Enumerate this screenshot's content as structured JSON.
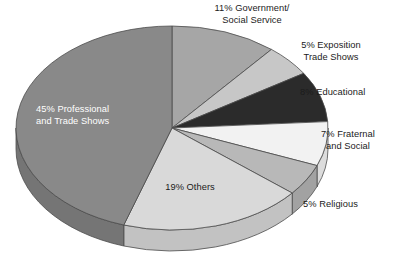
{
  "chart_data": {
    "type": "pie",
    "title": "",
    "subtitle": "",
    "xlabel": "",
    "ylabel": "",
    "legend_position": "none",
    "grid": false,
    "style": "3d-pie",
    "total": 100,
    "units": "percent",
    "categories": [
      "Government/Social Service",
      "Exposition Trade Shows",
      "Educational",
      "Fraternal and Social",
      "Religious",
      "Others",
      "Professional and Trade Shows"
    ],
    "values": [
      11,
      5,
      8,
      7,
      5,
      19,
      45
    ],
    "colors": [
      "#a6a6a6",
      "#c7c7c7",
      "#2b2b2b",
      "#f2f2f2",
      "#b8b8b8",
      "#d9d9d9",
      "#898989"
    ],
    "slices": [
      {
        "label": "11% Government/\nSocial Service",
        "name": "Government/Social Service",
        "value": 11,
        "color": "#a6a6a6",
        "side_color": "#8e8e8e",
        "label_placement": "outside-top",
        "label_color": "#1b1b1b"
      },
      {
        "label": "5% Exposition\nTrade Shows",
        "name": "Exposition Trade Shows",
        "value": 5,
        "color": "#c7c7c7",
        "side_color": "#b0b0b0",
        "label_placement": "outside-top-right",
        "label_color": "#1b1b1b"
      },
      {
        "label": "8% Educational",
        "name": "Educational",
        "value": 8,
        "color": "#2b2b2b",
        "side_color": "#1f1f1f",
        "label_placement": "outside-right",
        "label_color": "#1b1b1b"
      },
      {
        "label": "7% Fraternal\nand Social",
        "name": "Fraternal and Social",
        "value": 7,
        "color": "#f2f2f2",
        "side_color": "#dcdcdc",
        "label_placement": "outside-right",
        "label_color": "#1b1b1b"
      },
      {
        "label": "5% Religious",
        "name": "Religious",
        "value": 5,
        "color": "#b8b8b8",
        "side_color": "#a2a2a2",
        "label_placement": "outside-bottom-right",
        "label_color": "#1b1b1b"
      },
      {
        "label": "19% Others",
        "name": "Others",
        "value": 19,
        "color": "#d9d9d9",
        "side_color": "#c2c2c2",
        "label_placement": "inside",
        "label_color": "#1b1b1b"
      },
      {
        "label": "45% Professional\nand Trade Shows",
        "name": "Professional and Trade Shows",
        "value": 45,
        "color": "#898989",
        "side_color": "#757575",
        "label_placement": "inside",
        "label_color": "#ffffff"
      }
    ]
  },
  "geometry": {
    "cx": 172,
    "cy": 128,
    "rx": 156,
    "ry": 102,
    "depth": 21,
    "start_angle_deg": -90,
    "direction": "clockwise",
    "stroke": "#4d4d4d"
  }
}
